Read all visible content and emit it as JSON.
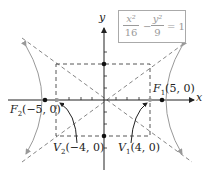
{
  "equation": {
    "term1_num": "x²",
    "term1_den": "16",
    "minus": "−",
    "term2_num": "y²",
    "term2_den": "9",
    "equals": "= 1"
  },
  "axes": {
    "x_label": "x",
    "y_label": "y"
  },
  "points": {
    "F1": {
      "name": "F",
      "sub": "1",
      "coords": "(5, 0)"
    },
    "F2": {
      "name": "F",
      "sub": "2",
      "coords": "(−5, 0)"
    },
    "V1": {
      "name": "V",
      "sub": "1",
      "coords": "(4, 0)"
    },
    "V2": {
      "name": "V",
      "sub": "2",
      "coords": "(−4, 0)"
    }
  },
  "colors": {
    "axis": "#222222",
    "curve": "#9a9a9a",
    "dashed": "#555555"
  }
}
